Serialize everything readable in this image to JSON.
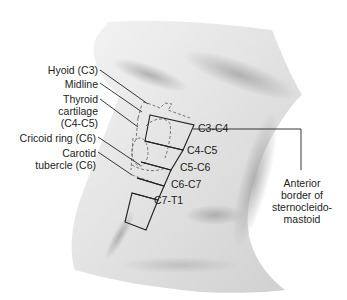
{
  "diagram": {
    "left_labels": [
      {
        "id": "hyoid",
        "text": "Hyoid (C3)"
      },
      {
        "id": "midline",
        "text": "Midline"
      },
      {
        "id": "thyroid_1",
        "text": "Thyroid"
      },
      {
        "id": "thyroid_2",
        "text": "cartilage"
      },
      {
        "id": "thyroid_3",
        "text": "(C4-C5)"
      },
      {
        "id": "cricoid",
        "text": "Cricoid ring (C6)"
      },
      {
        "id": "carotid_1",
        "text": "Carotid"
      },
      {
        "id": "carotid_2",
        "text": "tubercle (C6)"
      }
    ],
    "levels": [
      "C3-C4",
      "C4-C5",
      "C5-C6",
      "C6-C7",
      "C7-T1"
    ],
    "right_label": {
      "line1": "Anterior",
      "line2": "border of",
      "line3": "sternocleido-",
      "line4": "mastoid"
    },
    "colors": {
      "skin_light": "#f2f2f2",
      "skin_mid": "#d6d6d6",
      "skin_dark": "#9a9a9a",
      "line": "#222222",
      "dash": "#777777"
    }
  }
}
